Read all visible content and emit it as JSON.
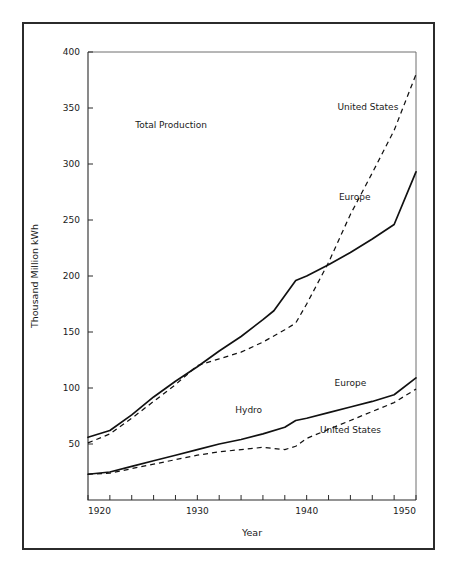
{
  "chart_data": {
    "type": "line",
    "title": "",
    "xlabel": "Year",
    "ylabel": "Thousand Million kWh",
    "xlim": [
      1920,
      1950
    ],
    "ylim": [
      0,
      400
    ],
    "grid": false,
    "legend_position": "inline-annotations",
    "x_ticks": [
      1920,
      1930,
      1940,
      1950
    ],
    "x_tick_labels": [
      "1920",
      "1930",
      "1940",
      "1950"
    ],
    "x_minor_tick_interval": 2,
    "y_ticks": [
      50,
      100,
      150,
      200,
      250,
      300,
      350,
      400
    ],
    "y_tick_labels": [
      "50",
      "100",
      "150",
      "200",
      "250",
      "300",
      "350",
      "400"
    ],
    "annotations": [
      {
        "text": "Total Production",
        "x": 1927.6,
        "y": 332
      },
      {
        "text": "Hydro",
        "x": 1934.7,
        "y": 78
      }
    ],
    "series": [
      {
        "name": "United States",
        "group": "Total Production",
        "style": "dashed",
        "label": "United States",
        "label_x": 1945.6,
        "label_y": 348,
        "x": [
          1920,
          1922,
          1924,
          1926,
          1928,
          1930,
          1932,
          1934,
          1936,
          1938,
          1939,
          1940,
          1942,
          1944,
          1946,
          1948,
          1950
        ],
        "y": [
          51,
          59,
          73,
          88,
          103,
          120,
          126,
          132,
          141,
          152,
          158,
          175,
          212,
          255,
          292,
          330,
          380
        ]
      },
      {
        "name": "Europe",
        "group": "Total Production",
        "style": "solid",
        "label": "Europe",
        "label_x": 1944.4,
        "label_y": 268,
        "x": [
          1920,
          1922,
          1924,
          1926,
          1928,
          1930,
          1932,
          1934,
          1936,
          1937,
          1939,
          1940,
          1942,
          1944,
          1946,
          1948,
          1950
        ],
        "y": [
          56,
          62,
          76,
          92,
          106,
          119,
          133,
          146,
          161,
          169,
          196,
          200,
          210,
          221,
          233,
          246,
          293
        ]
      },
      {
        "name": "Europe",
        "group": "Hydro",
        "style": "solid",
        "label": "Europe",
        "label_x": 1944.0,
        "label_y": 102,
        "x": [
          1920,
          1922,
          1924,
          1926,
          1928,
          1930,
          1932,
          1934,
          1936,
          1938,
          1939,
          1940,
          1942,
          1944,
          1946,
          1948,
          1950
        ],
        "y": [
          23,
          25,
          30,
          35,
          40,
          45,
          50,
          54,
          59,
          65,
          71,
          73,
          78,
          83,
          88,
          94,
          109
        ]
      },
      {
        "name": "United States",
        "group": "Hydro",
        "style": "dashed",
        "label": "United States",
        "label_x": 1944.0,
        "label_y": 60,
        "x": [
          1920,
          1922,
          1924,
          1926,
          1928,
          1930,
          1932,
          1934,
          1936,
          1938,
          1939,
          1940,
          1942,
          1944,
          1946,
          1948,
          1950
        ],
        "y": [
          23,
          24,
          28,
          32,
          36,
          40,
          43,
          45,
          47,
          45,
          48,
          55,
          63,
          71,
          79,
          87,
          99
        ]
      }
    ]
  }
}
